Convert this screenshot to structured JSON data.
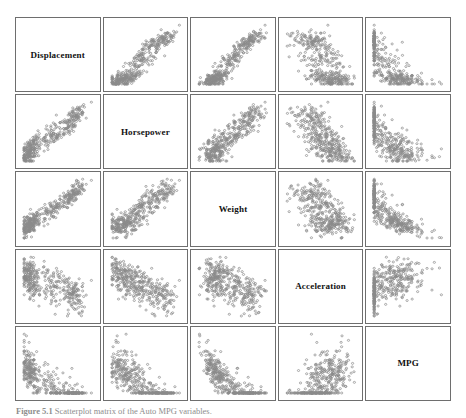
{
  "figure": {
    "caption_label": "Figure 5.1",
    "caption_text": "Scatterplot matrix of the Auto MPG variables.",
    "point_color": "#8a8a8a",
    "point_fill": "none",
    "border_color": "#6e6e6e",
    "background_color": "#ffffff",
    "label_color": "#111111"
  },
  "chart_data": {
    "type": "scatter",
    "title": "Scatterplot matrix of the Auto MPG variables.",
    "layout": "scatterplot-matrix",
    "grid_rows": 5,
    "grid_cols": 5,
    "grid": false,
    "legend": "none",
    "axis_ticks": false,
    "variables": [
      {
        "name": "Displacement",
        "index": 0,
        "range": [
          68,
          455
        ],
        "unit": "cubic inches"
      },
      {
        "name": "Horsepower",
        "index": 1,
        "range": [
          46,
          230
        ],
        "unit": "hp"
      },
      {
        "name": "Weight",
        "index": 2,
        "range": [
          1613,
          5140
        ],
        "unit": "lbs"
      },
      {
        "name": "Acceleration",
        "index": 3,
        "range": [
          8,
          24.8
        ],
        "unit": "sec 0-60"
      },
      {
        "name": "MPG",
        "index": 4,
        "range": [
          9,
          46.6
        ],
        "unit": "miles per gallon"
      }
    ],
    "n_points": 392,
    "correlations": [
      [
        1.0,
        0.9,
        0.93,
        -0.54,
        -0.8
      ],
      [
        0.9,
        1.0,
        0.86,
        -0.69,
        -0.78
      ],
      [
        0.93,
        0.86,
        1.0,
        -0.42,
        -0.83
      ],
      [
        -0.54,
        -0.69,
        -0.42,
        1.0,
        0.42
      ],
      [
        -0.8,
        -0.78,
        -0.83,
        0.42,
        1.0
      ]
    ],
    "panels": [
      {
        "row": 0,
        "col": 0,
        "type": "diagonal",
        "label": "Displacement"
      },
      {
        "row": 0,
        "col": 1,
        "x": "Horsepower",
        "y": "Displacement",
        "relation": "strong positive linear",
        "r": 0.9
      },
      {
        "row": 0,
        "col": 2,
        "x": "Weight",
        "y": "Displacement",
        "relation": "strong positive linear",
        "r": 0.93
      },
      {
        "row": 0,
        "col": 3,
        "x": "Acceleration",
        "y": "Displacement",
        "relation": "moderate negative",
        "r": -0.54
      },
      {
        "row": 0,
        "col": 4,
        "x": "MPG",
        "y": "Displacement",
        "relation": "strong negative curved",
        "r": -0.8
      },
      {
        "row": 1,
        "col": 0,
        "x": "Displacement",
        "y": "Horsepower",
        "relation": "strong positive linear",
        "r": 0.9
      },
      {
        "row": 1,
        "col": 1,
        "type": "diagonal",
        "label": "Horsepower"
      },
      {
        "row": 1,
        "col": 2,
        "x": "Weight",
        "y": "Horsepower",
        "relation": "strong positive linear",
        "r": 0.86
      },
      {
        "row": 1,
        "col": 3,
        "x": "Acceleration",
        "y": "Horsepower",
        "relation": "strong negative curved",
        "r": -0.69
      },
      {
        "row": 1,
        "col": 4,
        "x": "MPG",
        "y": "Horsepower",
        "relation": "strong negative curved",
        "r": -0.78
      },
      {
        "row": 2,
        "col": 0,
        "x": "Displacement",
        "y": "Weight",
        "relation": "strong positive linear",
        "r": 0.93
      },
      {
        "row": 2,
        "col": 1,
        "x": "Horsepower",
        "y": "Weight",
        "relation": "strong positive linear",
        "r": 0.86
      },
      {
        "row": 2,
        "col": 2,
        "type": "diagonal",
        "label": "Weight"
      },
      {
        "row": 2,
        "col": 3,
        "x": "Acceleration",
        "y": "Weight",
        "relation": "weak negative",
        "r": -0.42
      },
      {
        "row": 2,
        "col": 4,
        "x": "MPG",
        "y": "Weight",
        "relation": "strong negative curved",
        "r": -0.83
      },
      {
        "row": 3,
        "col": 0,
        "x": "Displacement",
        "y": "Acceleration",
        "relation": "moderate negative",
        "r": -0.54
      },
      {
        "row": 3,
        "col": 1,
        "x": "Horsepower",
        "y": "Acceleration",
        "relation": "strong negative curved",
        "r": -0.69
      },
      {
        "row": 3,
        "col": 2,
        "x": "Weight",
        "y": "Acceleration",
        "relation": "weak negative",
        "r": -0.42
      },
      {
        "row": 3,
        "col": 3,
        "type": "diagonal",
        "label": "Acceleration"
      },
      {
        "row": 3,
        "col": 4,
        "x": "MPG",
        "y": "Acceleration",
        "relation": "weak positive",
        "r": 0.42
      },
      {
        "row": 4,
        "col": 0,
        "x": "Displacement",
        "y": "MPG",
        "relation": "strong negative curved",
        "r": -0.8
      },
      {
        "row": 4,
        "col": 1,
        "x": "Horsepower",
        "y": "MPG",
        "relation": "strong negative curved",
        "r": -0.78
      },
      {
        "row": 4,
        "col": 2,
        "x": "Weight",
        "y": "MPG",
        "relation": "strong negative curved",
        "r": -0.83
      },
      {
        "row": 4,
        "col": 3,
        "x": "Acceleration",
        "y": "MPG",
        "relation": "weak positive",
        "r": 0.42
      },
      {
        "row": 4,
        "col": 4,
        "type": "diagonal",
        "label": "MPG"
      }
    ]
  }
}
